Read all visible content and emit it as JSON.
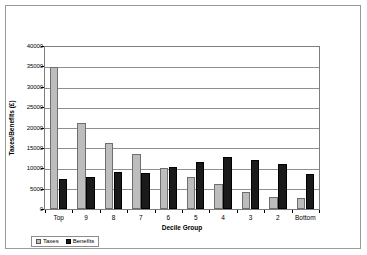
{
  "chart_data": {
    "type": "bar",
    "title": "",
    "xlabel": "Decile Group",
    "ylabel": "Taxes/Benefits (£)",
    "ylim": [
      0,
      40000
    ],
    "ytick_interval": 5000,
    "yticks": [
      "40000",
      "35000",
      "30000",
      "25000",
      "20000",
      "15000",
      "10000",
      "5000",
      "0"
    ],
    "grid": true,
    "legend_position": "bottom-left",
    "categories": [
      "Top",
      "9",
      "8",
      "7",
      "6",
      "5",
      "4",
      "3",
      "2",
      "Bottom"
    ],
    "series": [
      {
        "name": "Taxes",
        "color": "#bdbdbd",
        "values": [
          35000,
          21200,
          16300,
          13500,
          10200,
          8000,
          6100,
          4300,
          3000,
          2700
        ]
      },
      {
        "name": "Benefits",
        "color": "#1a1a1a",
        "values": [
          7300,
          8000,
          9100,
          8900,
          10300,
          11700,
          12800,
          12000,
          11200,
          8700
        ]
      }
    ]
  },
  "legend": {
    "items": [
      {
        "label": "Taxes",
        "swatch": "taxes"
      },
      {
        "label": "Benefits",
        "swatch": "benefits"
      }
    ]
  }
}
